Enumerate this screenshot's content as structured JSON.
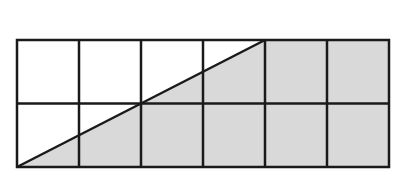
{
  "diagram": {
    "grid": {
      "rows": 2,
      "cols": 6,
      "left": 17,
      "top": 40,
      "cell_width": 62,
      "cell_height": 63.5
    },
    "diagonal": {
      "from": [
        17,
        167
      ],
      "to": [
        265,
        40
      ]
    },
    "shaded_polygon": [
      [
        17,
        167
      ],
      [
        265,
        40
      ],
      [
        389,
        40
      ],
      [
        389,
        167
      ]
    ],
    "colors": {
      "background": "#ffffff",
      "shade": "#d9d9d9",
      "line": "#1a1a1a"
    },
    "line_width": 2.5
  }
}
